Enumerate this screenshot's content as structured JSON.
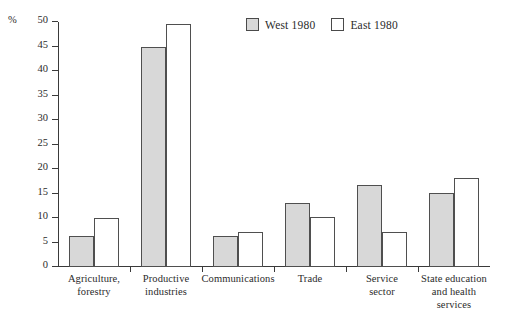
{
  "chart_data": {
    "type": "bar",
    "title": "",
    "xlabel": "",
    "ylabel": "%",
    "ylim": [
      0,
      50
    ],
    "yticks": [
      0,
      5,
      10,
      15,
      20,
      25,
      30,
      35,
      40,
      45,
      50
    ],
    "grid": false,
    "legend_position": "top-center",
    "categories": [
      "Agriculture,\nforestry",
      "Productive\nindustries",
      "Communications",
      "Trade",
      "Service\nsector",
      "State education\nand health\nservices"
    ],
    "series": [
      {
        "name": "West 1980",
        "color": "#d8d8d8",
        "values": [
          6.3,
          45.0,
          6.3,
          13.0,
          16.8,
          15.2
        ]
      },
      {
        "name": "East 1980",
        "color": "#ffffff",
        "values": [
          10.0,
          49.5,
          7.2,
          10.2,
          7.2,
          18.2
        ]
      }
    ]
  },
  "legend": {
    "entries": [
      {
        "label": "West 1980",
        "swatch": "gray"
      },
      {
        "label": "East 1980",
        "swatch": "white"
      }
    ]
  },
  "axis": {
    "unit_symbol": "%"
  }
}
